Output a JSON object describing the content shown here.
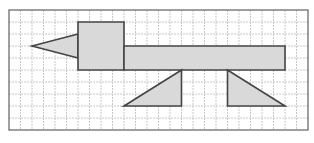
{
  "diagram": {
    "title": "Shapes on a square grid",
    "grid": {
      "columns": 26,
      "rows": 10,
      "origin_x": 9,
      "origin_y": 10,
      "cell_width": 11.5,
      "cell_height": 12,
      "line_color": "#c8c8c8",
      "border_color": "#777777"
    },
    "fill_color": "#d9d9d9",
    "stroke_color": "#444444",
    "shapes": [
      {
        "name": "beak-triangle",
        "type": "triangle",
        "points": [
          [
            2,
            3
          ],
          [
            6,
            2
          ],
          [
            6,
            4
          ]
        ]
      },
      {
        "name": "head-square",
        "type": "square",
        "points": [
          [
            6,
            1
          ],
          [
            10,
            1
          ],
          [
            10,
            5
          ],
          [
            6,
            5
          ]
        ]
      },
      {
        "name": "body-rectangle",
        "type": "rectangle",
        "points": [
          [
            10,
            3
          ],
          [
            24,
            3
          ],
          [
            24,
            5
          ],
          [
            10,
            5
          ]
        ]
      },
      {
        "name": "front-leg-triangle",
        "type": "right-triangle",
        "points": [
          [
            10,
            8
          ],
          [
            15,
            5
          ],
          [
            15,
            8
          ]
        ]
      },
      {
        "name": "back-leg-triangle",
        "type": "right-triangle",
        "points": [
          [
            19,
            5
          ],
          [
            19,
            8
          ],
          [
            24,
            8
          ]
        ]
      }
    ]
  }
}
